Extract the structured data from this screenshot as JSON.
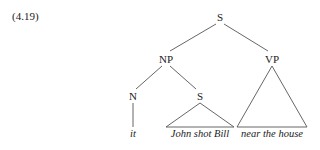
{
  "example_number": "(4.19)",
  "tree": {
    "root": "S",
    "np": "NP",
    "vp": "VP",
    "n": "N",
    "embedded_s": "S",
    "leaves": {
      "n": "it",
      "embedded_s": "John shot Bill",
      "vp": "near the house"
    }
  }
}
